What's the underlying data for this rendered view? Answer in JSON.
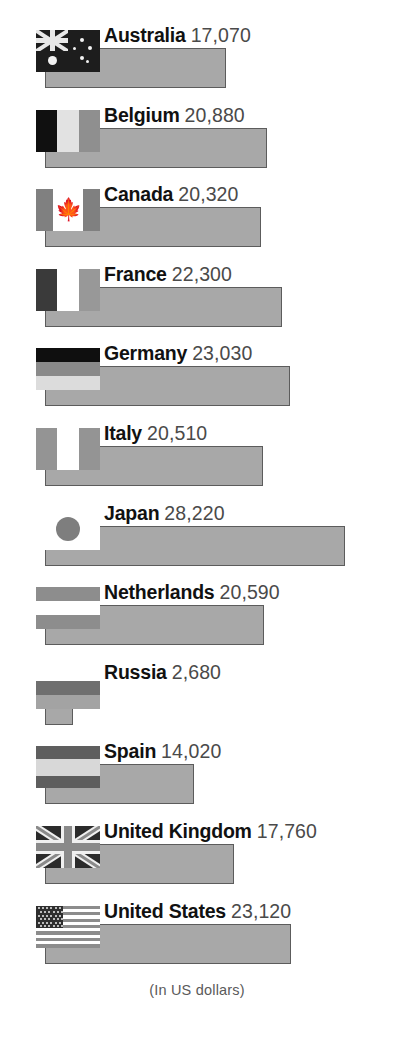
{
  "chart_data": {
    "type": "bar",
    "title": "",
    "subtitle": "",
    "orientation": "horizontal",
    "xlabel": "",
    "ylabel": "",
    "footnote": "(In US dollars)",
    "value_unit": "US dollars",
    "grid": false,
    "legend": false,
    "axis_visible": false,
    "xlim": [
      0,
      28220
    ],
    "categories": [
      "Australia",
      "Belgium",
      "Canada",
      "France",
      "Germany",
      "Italy",
      "Japan",
      "Netherlands",
      "Russia",
      "Spain",
      "United Kingdom",
      "United States"
    ],
    "values": [
      17070,
      20880,
      20320,
      22300,
      23030,
      20510,
      28220,
      20590,
      2680,
      14020,
      17760,
      23120
    ],
    "value_labels": [
      "17,070",
      "20,880",
      "20,320",
      "22,300",
      "23,030",
      "20,510",
      "28,220",
      "20,590",
      "2,680",
      "14,020",
      "17,760",
      "23,120"
    ]
  },
  "style": {
    "bar_fill": "#a8a8a8",
    "bar_border": "#5c5c5c",
    "country_color": "#111111",
    "value_color": "#4a4a4a",
    "footnote_color": "#5a5a5a",
    "background": "#ffffff"
  },
  "rows": [
    {
      "country": "Australia",
      "value_label": "17,070",
      "value": 17070,
      "flag": "flag-australia",
      "flag_class": "fl-au"
    },
    {
      "country": "Belgium",
      "value_label": "20,880",
      "value": 20880,
      "flag": "flag-belgium",
      "flag_class": "fl-be"
    },
    {
      "country": "Canada",
      "value_label": "20,320",
      "value": 20320,
      "flag": "flag-canada",
      "flag_class": "fl-ca"
    },
    {
      "country": "France",
      "value_label": "22,300",
      "value": 22300,
      "flag": "flag-france",
      "flag_class": "fl-fr"
    },
    {
      "country": "Germany",
      "value_label": "23,030",
      "value": 23030,
      "flag": "flag-germany",
      "flag_class": "fl-de"
    },
    {
      "country": "Italy",
      "value_label": "20,510",
      "value": 20510,
      "flag": "flag-italy",
      "flag_class": "fl-it"
    },
    {
      "country": "Japan",
      "value_label": "28,220",
      "value": 28220,
      "flag": "flag-japan",
      "flag_class": "fl-jp"
    },
    {
      "country": "Netherlands",
      "value_label": "20,590",
      "value": 20590,
      "flag": "flag-netherlands",
      "flag_class": "fl-nl"
    },
    {
      "country": "Russia",
      "value_label": "2,680",
      "value": 2680,
      "flag": "flag-russia",
      "flag_class": "fl-ru"
    },
    {
      "country": "Spain",
      "value_label": "14,020",
      "value": 14020,
      "flag": "flag-spain",
      "flag_class": "fl-es"
    },
    {
      "country": "United Kingdom",
      "value_label": "17,760",
      "value": 17760,
      "flag": "flag-united-kingdom",
      "flag_class": "fl-gb"
    },
    {
      "country": "United States",
      "value_label": "23,120",
      "value": 23120,
      "flag": "flag-united-states",
      "flag_class": "fl-us"
    }
  ],
  "footnote": "(In US dollars)"
}
